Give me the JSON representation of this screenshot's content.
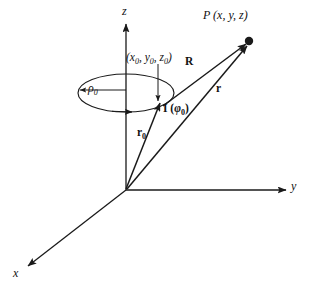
{
  "figure": {
    "kind": "physics-vector-diagram",
    "background_color": "#ffffff",
    "stroke_color": "#1a1a1a"
  },
  "axes": {
    "z_label": "z",
    "y_label": "y",
    "x_label": "x",
    "origin": {
      "x": 126,
      "y": 190
    }
  },
  "labels": {
    "field_point": "P (x, y, z)",
    "source_coords_open": "(",
    "source_coords": "(x0, y0, z0)",
    "radius": "ρ0",
    "vector_R": "R",
    "vector_r": "r",
    "vector_r0": "r0",
    "current": "I (φ0)"
  },
  "label_parts": {
    "coord_x": "x",
    "coord_y": "y",
    "coord_z": "z",
    "zero": "0",
    "rho": "ρ",
    "phi": "φ",
    "R": "R",
    "r": "r",
    "I": "I"
  },
  "geometry": {
    "loop_center": {
      "x": 126,
      "y": 93
    },
    "loop_rx": 48,
    "loop_ry": 19,
    "source_point": {
      "x": 161,
      "y": 105
    },
    "field_point": {
      "x": 249,
      "y": 41
    },
    "radius_arrow_from": {
      "x": 126,
      "y": 90
    },
    "radius_arrow_to": {
      "x": 80,
      "y": 90
    }
  }
}
